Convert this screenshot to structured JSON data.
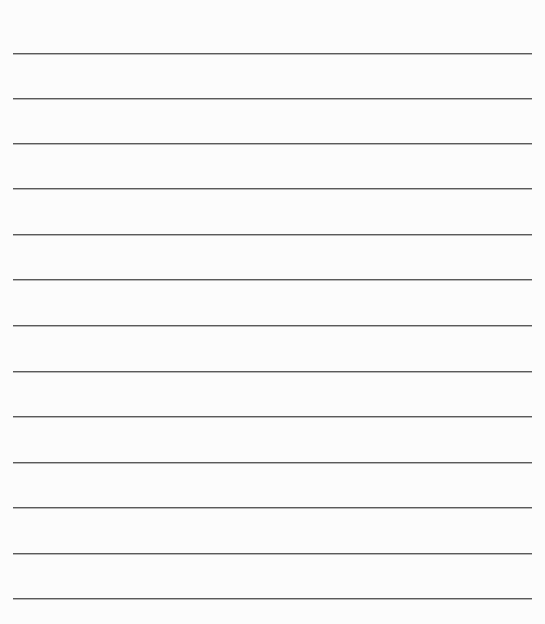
{
  "document": {
    "type": "lined-paper",
    "background_color": "#fcfcfc",
    "rule_color": "#5a5a5a",
    "rule_left_px": 13,
    "rule_right_px": 532,
    "rules_y_px": [
      53,
      98,
      143,
      188,
      234,
      279,
      325,
      371,
      416,
      462,
      507,
      553,
      598
    ],
    "text": ""
  }
}
